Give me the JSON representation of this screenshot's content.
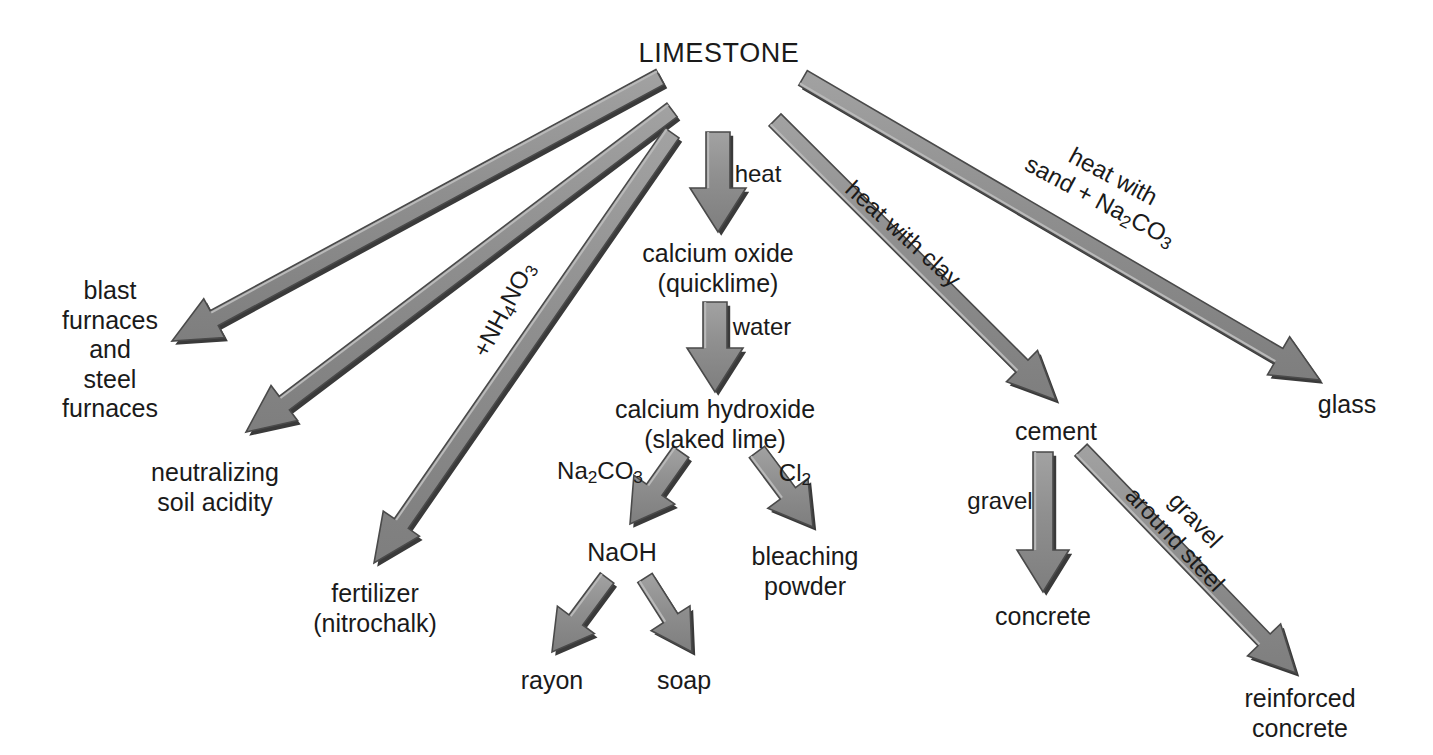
{
  "diagram": {
    "title": "LIMESTONE",
    "background_color": "#ffffff",
    "arrow_fill": "#8c8c8c",
    "arrow_stroke": "#4a4a4a",
    "arrow_shadow": "#3a3a3a",
    "text_color": "#1a1a1a"
  },
  "nodes": [
    {
      "id": "limestone",
      "label": "LIMESTONE",
      "x": 719,
      "y": 54
    },
    {
      "id": "blast_furnaces",
      "label": "blast\nfurnaces\nand\nsteel\nfurnaces",
      "x": 110,
      "y": 350
    },
    {
      "id": "neutralizing",
      "label": "neutralizing\nsoil acidity",
      "x": 215,
      "y": 487
    },
    {
      "id": "fertilizer",
      "label": "fertilizer\n(nitrochalk)",
      "x": 375,
      "y": 608
    },
    {
      "id": "calcium_oxide",
      "label": "calcium oxide\n(quicklime)",
      "x": 718,
      "y": 268
    },
    {
      "id": "calcium_hydroxide",
      "label": "calcium hydroxide\n(slaked lime)",
      "x": 715,
      "y": 424
    },
    {
      "id": "naoh",
      "label": "NaOH",
      "x": 622,
      "y": 553
    },
    {
      "id": "bleaching_powder",
      "label": "bleaching\npowder",
      "x": 805,
      "y": 571
    },
    {
      "id": "rayon",
      "label": "rayon",
      "x": 552,
      "y": 681
    },
    {
      "id": "soap",
      "label": "soap",
      "x": 684,
      "y": 681
    },
    {
      "id": "cement",
      "label": "cement",
      "x": 1056,
      "y": 432
    },
    {
      "id": "concrete",
      "label": "concrete",
      "x": 1043,
      "y": 617
    },
    {
      "id": "reinforced_concrete",
      "label": "reinforced\nconcrete",
      "x": 1300,
      "y": 713
    },
    {
      "id": "glass",
      "label": "glass",
      "x": 1347,
      "y": 405
    }
  ],
  "edge_labels": [
    {
      "id": "heat",
      "text": "heat",
      "x": 758,
      "y": 174,
      "rotate": 0,
      "lines": [
        "heat"
      ]
    },
    {
      "id": "water",
      "text": "water",
      "x": 762,
      "y": 327,
      "rotate": 0,
      "lines": [
        "water"
      ]
    },
    {
      "id": "nh4no3",
      "text": "+NH4NO3",
      "x": 505,
      "y": 310,
      "rotate": -62,
      "lines": [
        "+NH₄NO₃"
      ]
    },
    {
      "id": "heat_with_clay",
      "text": "heat with clay",
      "x": 903,
      "y": 234,
      "rotate": 42,
      "lines": [
        "heat with clay"
      ]
    },
    {
      "id": "heat_sand_na2co3",
      "text": "heat with sand + Na2CO3",
      "x": 1106,
      "y": 190,
      "rotate": 28,
      "lines": [
        "heat with",
        "sand + Na₂CO₃"
      ]
    },
    {
      "id": "na2co3_in",
      "text": "Na2CO3",
      "x": 600,
      "y": 472,
      "rotate": 0,
      "lines": [
        "Na₂CO₃"
      ]
    },
    {
      "id": "cl2_in",
      "text": "Cl2",
      "x": 795,
      "y": 474,
      "rotate": 0,
      "lines": [
        "Cl₂"
      ]
    },
    {
      "id": "gravel",
      "text": "gravel",
      "x": 1000,
      "y": 501,
      "rotate": 0,
      "lines": [
        "gravel"
      ]
    },
    {
      "id": "gravel_steel",
      "text": "gravel around steel",
      "x": 1185,
      "y": 530,
      "rotate": 47,
      "lines": [
        "gravel",
        "around steel"
      ]
    }
  ],
  "arrows": [
    {
      "id": "limestone-to-blast",
      "from": "limestone",
      "to": "blast_furnaces",
      "x1": 660,
      "y1": 77,
      "x2": 172,
      "y2": 341,
      "width": 17,
      "head_width": 44,
      "head_length": 48
    },
    {
      "id": "limestone-to-neutralizing",
      "from": "limestone",
      "to": "neutralizing",
      "x1": 672,
      "y1": 110,
      "x2": 246,
      "y2": 432,
      "width": 17,
      "head_width": 44,
      "head_length": 48
    },
    {
      "id": "limestone-to-fertilizer",
      "from": "limestone",
      "to": "fertilizer",
      "x1": 672,
      "y1": 133,
      "x2": 374,
      "y2": 563,
      "width": 17,
      "head_width": 44,
      "head_length": 48
    },
    {
      "id": "limestone-to-calcium-oxide",
      "from": "limestone",
      "to": "calcium_oxide",
      "x1": 718,
      "y1": 132,
      "x2": 718,
      "y2": 232,
      "width": 24,
      "head_width": 56,
      "head_length": 44
    },
    {
      "id": "limestone-to-cement",
      "from": "limestone",
      "to": "cement",
      "x1": 775,
      "y1": 120,
      "x2": 1056,
      "y2": 400,
      "width": 17,
      "head_width": 44,
      "head_length": 48
    },
    {
      "id": "limestone-to-glass",
      "from": "limestone",
      "to": "glass",
      "x1": 803,
      "y1": 78,
      "x2": 1320,
      "y2": 380,
      "width": 17,
      "head_width": 44,
      "head_length": 48
    },
    {
      "id": "oxide-to-hydroxide",
      "from": "calcium_oxide",
      "to": "calcium_hydroxide",
      "x1": 715,
      "y1": 302,
      "x2": 715,
      "y2": 392,
      "width": 24,
      "head_width": 56,
      "head_length": 44
    },
    {
      "id": "hydroxide-to-naoh",
      "from": "calcium_hydroxide",
      "to": "naoh",
      "x1": 681,
      "y1": 452,
      "x2": 630,
      "y2": 524,
      "width": 19,
      "head_width": 50,
      "head_length": 42
    },
    {
      "id": "hydroxide-to-bleaching",
      "from": "calcium_hydroxide",
      "to": "bleaching_powder",
      "x1": 757,
      "y1": 452,
      "x2": 813,
      "y2": 527,
      "width": 19,
      "head_width": 50,
      "head_length": 42
    },
    {
      "id": "naoh-to-rayon",
      "from": "naoh",
      "to": "rayon",
      "x1": 607,
      "y1": 578,
      "x2": 552,
      "y2": 652,
      "width": 17,
      "head_width": 46,
      "head_length": 40
    },
    {
      "id": "naoh-to-soap",
      "from": "naoh",
      "to": "soap",
      "x1": 645,
      "y1": 578,
      "x2": 692,
      "y2": 652,
      "width": 17,
      "head_width": 46,
      "head_length": 40
    },
    {
      "id": "cement-to-concrete",
      "from": "cement",
      "to": "concrete",
      "x1": 1043,
      "y1": 452,
      "x2": 1043,
      "y2": 592,
      "width": 20,
      "head_width": 52,
      "head_length": 42
    },
    {
      "id": "cement-to-reinforced",
      "from": "cement",
      "to": "reinforced_concrete",
      "x1": 1081,
      "y1": 450,
      "x2": 1296,
      "y2": 673,
      "width": 17,
      "head_width": 46,
      "head_length": 46
    }
  ]
}
